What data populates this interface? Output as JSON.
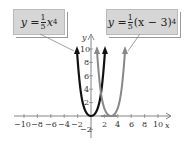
{
  "labels": {
    "left_equation": {
      "lhs": "y =",
      "num": "1",
      "den": "5",
      "rest": "x",
      "exp": "4"
    },
    "right_equation": {
      "lhs": "y =",
      "num": "1",
      "den": "5",
      "rest": "(x − 3)",
      "exp": "4"
    },
    "x_axis": "x",
    "y_axis": "y"
  },
  "axes": {
    "x_ticks": [
      "−10",
      "−8",
      "−6",
      "−4",
      "−2",
      "2",
      "4",
      "6",
      "8",
      "10"
    ],
    "y_ticks": [
      "10",
      "8",
      "6",
      "4",
      "2",
      "−2"
    ]
  },
  "colors": {
    "curve1": "#111111",
    "curve2": "#808080",
    "box": "#d6d6d6"
  }
}
